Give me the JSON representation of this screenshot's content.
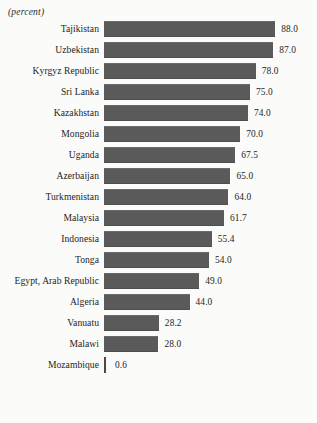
{
  "figure": {
    "clipped_title": "",
    "unit_label": "(percent)"
  },
  "chart_data": {
    "type": "bar",
    "orientation": "horizontal",
    "title": "",
    "subtitle": "(percent)",
    "xlabel": "",
    "ylabel": "",
    "unit": "percent",
    "grid": false,
    "legend": null,
    "xlim": [
      0,
      88
    ],
    "value_labels_shown": true,
    "bar_color": "#5a5a5a",
    "background_color": "#fbfbf9",
    "categories": [
      "Tajikistan",
      "Uzbekistan",
      "Kyrgyz Republic",
      "Sri Lanka",
      "Kazakhstan",
      "Mongolia",
      "Uganda",
      "Azerbaijan",
      "Turkmenistan",
      "Malaysia",
      "Indonesia",
      "Tonga",
      "Egypt, Arab Republic",
      "Algeria",
      "Vanuatu",
      "Malawi",
      "Mozambique"
    ],
    "values": [
      88.0,
      87.0,
      78.0,
      75.0,
      74.0,
      70.0,
      67.5,
      65.0,
      64.0,
      61.7,
      55.4,
      54.0,
      49.0,
      44.0,
      28.2,
      28.0,
      0.6
    ],
    "value_text": [
      "88.0",
      "87.0",
      "78.0",
      "75.0",
      "74.0",
      "70.0",
      "67.5",
      "65.0",
      "64.0",
      "61.7",
      "55.4",
      "54.0",
      "49.0",
      "44.0",
      "28.2",
      "28.0",
      "0.6"
    ],
    "rows": [
      {
        "label": "Tajikistan",
        "value": 88.0,
        "value_text": "88.0"
      },
      {
        "label": "Uzbekistan",
        "value": 87.0,
        "value_text": "87.0"
      },
      {
        "label": "Kyrgyz Republic",
        "value": 78.0,
        "value_text": "78.0"
      },
      {
        "label": "Sri Lanka",
        "value": 75.0,
        "value_text": "75.0"
      },
      {
        "label": "Kazakhstan",
        "value": 74.0,
        "value_text": "74.0"
      },
      {
        "label": "Mongolia",
        "value": 70.0,
        "value_text": "70.0"
      },
      {
        "label": "Uganda",
        "value": 67.5,
        "value_text": "67.5"
      },
      {
        "label": "Azerbaijan",
        "value": 65.0,
        "value_text": "65.0"
      },
      {
        "label": "Turkmenistan",
        "value": 64.0,
        "value_text": "64.0"
      },
      {
        "label": "Malaysia",
        "value": 61.7,
        "value_text": "61.7"
      },
      {
        "label": "Indonesia",
        "value": 55.4,
        "value_text": "55.4"
      },
      {
        "label": "Tonga",
        "value": 54.0,
        "value_text": "54.0"
      },
      {
        "label": "Egypt, Arab Republic",
        "value": 49.0,
        "value_text": "49.0"
      },
      {
        "label": "Algeria",
        "value": 44.0,
        "value_text": "44.0"
      },
      {
        "label": "Vanuatu",
        "value": 28.2,
        "value_text": "28.2"
      },
      {
        "label": "Malawi",
        "value": 28.0,
        "value_text": "28.0"
      },
      {
        "label": "Mozambique",
        "value": 0.6,
        "value_text": "0.6"
      }
    ]
  }
}
